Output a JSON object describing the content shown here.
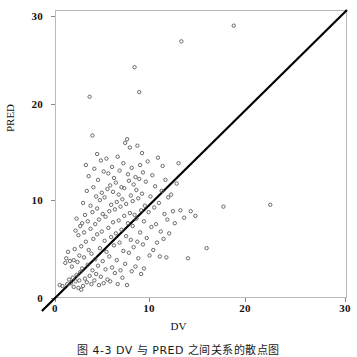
{
  "figure": {
    "caption": "图 4-3  DV 与 PRED 之间关系的散点图"
  },
  "axes": {
    "xlabel": "DV",
    "ylabel": "PRED",
    "x_ticks": [
      "0",
      "10",
      "20",
      "30"
    ],
    "y_ticks": [
      "0",
      "10",
      "20",
      "30"
    ]
  },
  "chart_data": {
    "type": "scatter",
    "title": "",
    "xlabel": "DV",
    "ylabel": "PRED",
    "xlim": [
      0,
      31.2
    ],
    "ylim": [
      0,
      31.2
    ],
    "xticks": [
      0,
      10,
      20,
      30
    ],
    "yticks": [
      0,
      10,
      20,
      30
    ],
    "grid": false,
    "legend": null,
    "marker": {
      "style": "open-circle",
      "size_px": 3.4,
      "color": "#5a5a5a",
      "fill": "none"
    },
    "reference_line": {
      "name": "identity-line",
      "type": "line",
      "equation": "y = x",
      "slope": 1,
      "intercept": 0,
      "x_from": -1.4,
      "x_to": 31.2,
      "color": "#000000",
      "width_px": 2.2
    },
    "series": [
      {
        "name": "DV vs PRED",
        "points": [
          [
            0.5,
            1.4
          ],
          [
            0.8,
            1.3
          ],
          [
            1.1,
            3.8
          ],
          [
            1.2,
            4.3
          ],
          [
            1.3,
            1.5
          ],
          [
            1.4,
            5.0
          ],
          [
            1.5,
            2.0
          ],
          [
            1.6,
            4.0
          ],
          [
            1.7,
            1.6
          ],
          [
            1.8,
            3.4
          ],
          [
            1.9,
            2.2
          ],
          [
            2.0,
            1.2
          ],
          [
            2.0,
            4.1
          ],
          [
            2.1,
            5.3
          ],
          [
            2.2,
            1.8
          ],
          [
            2.2,
            7.3
          ],
          [
            2.3,
            2.5
          ],
          [
            2.3,
            8.6
          ],
          [
            2.4,
            3.9
          ],
          [
            2.5,
            1.1
          ],
          [
            2.5,
            6.8
          ],
          [
            2.6,
            4.6
          ],
          [
            2.6,
            1.9
          ],
          [
            2.7,
            7.8
          ],
          [
            2.7,
            2.8
          ],
          [
            2.8,
            5.6
          ],
          [
            2.8,
            0.9
          ],
          [
            2.9,
            8.1
          ],
          [
            2.9,
            3.2
          ],
          [
            3.0,
            1.3
          ],
          [
            3.0,
            10.3
          ],
          [
            3.1,
            7.1
          ],
          [
            3.1,
            4.4
          ],
          [
            3.2,
            2.1
          ],
          [
            3.2,
            9.0
          ],
          [
            3.3,
            14.4
          ],
          [
            3.3,
            6.1
          ],
          [
            3.4,
            1.7
          ],
          [
            3.4,
            11.6
          ],
          [
            3.5,
            3.6
          ],
          [
            3.5,
            8.3
          ],
          [
            3.6,
            13.2
          ],
          [
            3.6,
            5.2
          ],
          [
            3.7,
            21.8
          ],
          [
            3.7,
            2.4
          ],
          [
            3.8,
            10.0
          ],
          [
            3.8,
            7.5
          ],
          [
            3.9,
            4.8
          ],
          [
            3.9,
            1.5
          ],
          [
            4.0,
            17.6
          ],
          [
            4.0,
            9.3
          ],
          [
            4.0,
            3.0
          ],
          [
            4.1,
            12.0
          ],
          [
            4.1,
            6.4
          ],
          [
            4.2,
            1.9
          ],
          [
            4.2,
            14.0
          ],
          [
            4.3,
            8.0
          ],
          [
            4.3,
            4.2
          ],
          [
            4.4,
            11.0
          ],
          [
            4.4,
            2.6
          ],
          [
            4.5,
            15.6
          ],
          [
            4.5,
            6.9
          ],
          [
            4.5,
            9.7
          ],
          [
            4.6,
            3.5
          ],
          [
            4.6,
            12.8
          ],
          [
            4.7,
            1.4
          ],
          [
            4.7,
            8.5
          ],
          [
            4.8,
            5.4
          ],
          [
            4.8,
            10.6
          ],
          [
            4.9,
            14.9
          ],
          [
            4.9,
            2.3
          ],
          [
            5.0,
            7.2
          ],
          [
            5.0,
            11.4
          ],
          [
            5.1,
            4.0
          ],
          [
            5.1,
            9.1
          ],
          [
            5.2,
            13.7
          ],
          [
            5.2,
            1.6
          ],
          [
            5.3,
            6.2
          ],
          [
            5.3,
            10.9
          ],
          [
            5.4,
            3.1
          ],
          [
            5.4,
            8.8
          ],
          [
            5.5,
            15.1
          ],
          [
            5.5,
            5.0
          ],
          [
            5.6,
            11.8
          ],
          [
            5.6,
            2.0
          ],
          [
            5.7,
            7.6
          ],
          [
            5.7,
            13.5
          ],
          [
            5.8,
            9.4
          ],
          [
            5.8,
            4.5
          ],
          [
            5.9,
            12.2
          ],
          [
            5.9,
            1.8
          ],
          [
            6.0,
            6.6
          ],
          [
            6.0,
            10.1
          ],
          [
            6.1,
            14.2
          ],
          [
            6.1,
            3.3
          ],
          [
            6.2,
            8.2
          ],
          [
            6.2,
            11.5
          ],
          [
            6.3,
            5.7
          ],
          [
            6.3,
            13.0
          ],
          [
            6.4,
            2.7
          ],
          [
            6.4,
            9.6
          ],
          [
            6.5,
            7.0
          ],
          [
            6.5,
            12.5
          ],
          [
            6.6,
            4.1
          ],
          [
            6.6,
            10.4
          ],
          [
            6.7,
            15.3
          ],
          [
            6.7,
            1.5
          ],
          [
            6.8,
            8.4
          ],
          [
            6.8,
            11.2
          ],
          [
            6.9,
            6.0
          ],
          [
            6.9,
            13.8
          ],
          [
            7.0,
            3.0
          ],
          [
            7.0,
            9.9
          ],
          [
            7.1,
            12.0
          ],
          [
            7.1,
            7.4
          ],
          [
            7.2,
            2.2
          ],
          [
            7.2,
            10.7
          ],
          [
            7.3,
            14.6
          ],
          [
            7.3,
            5.1
          ],
          [
            7.4,
            8.9
          ],
          [
            7.4,
            11.9
          ],
          [
            7.5,
            3.7
          ],
          [
            7.5,
            16.8
          ],
          [
            7.6,
            6.7
          ],
          [
            7.6,
            10.2
          ],
          [
            7.7,
            17.2
          ],
          [
            7.7,
            1.4
          ],
          [
            7.8,
            13.4
          ],
          [
            7.8,
            8.1
          ],
          [
            7.9,
            12.7
          ],
          [
            7.9,
            4.9
          ],
          [
            8.0,
            16.3
          ],
          [
            8.0,
            9.2
          ],
          [
            8.1,
            11.1
          ],
          [
            8.1,
            6.3
          ],
          [
            8.2,
            14.1
          ],
          [
            8.2,
            2.9
          ],
          [
            8.3,
            10.5
          ],
          [
            8.3,
            7.8
          ],
          [
            8.4,
            12.3
          ],
          [
            8.4,
            5.5
          ],
          [
            8.5,
            25.0
          ],
          [
            8.5,
            9.0
          ],
          [
            8.6,
            13.1
          ],
          [
            8.6,
            3.4
          ],
          [
            8.7,
            11.7
          ],
          [
            8.7,
            8.6
          ],
          [
            8.8,
            16.5
          ],
          [
            8.8,
            6.1
          ],
          [
            8.9,
            10.8
          ],
          [
            8.9,
            4.3
          ],
          [
            9.0,
            22.3
          ],
          [
            9.0,
            12.9
          ],
          [
            9.1,
            14.4
          ],
          [
            9.1,
            7.1
          ],
          [
            9.2,
            9.5
          ],
          [
            9.2,
            2.6
          ],
          [
            9.3,
            15.7
          ],
          [
            9.3,
            11.3
          ],
          [
            9.4,
            5.8
          ],
          [
            9.4,
            13.6
          ],
          [
            9.5,
            8.3
          ],
          [
            9.5,
            3.2
          ],
          [
            9.6,
            10.0
          ],
          [
            9.7,
            12.6
          ],
          [
            9.8,
            6.5
          ],
          [
            9.9,
            14.8
          ],
          [
            10.0,
            9.3
          ],
          [
            10.1,
            4.6
          ],
          [
            10.2,
            11.0
          ],
          [
            10.3,
            7.7
          ],
          [
            10.4,
            13.3
          ],
          [
            10.5,
            5.2
          ],
          [
            10.6,
            9.8
          ],
          [
            10.7,
            12.1
          ],
          [
            10.8,
            8.0
          ],
          [
            10.9,
            6.0
          ],
          [
            11.0,
            15.2
          ],
          [
            11.1,
            10.3
          ],
          [
            11.2,
            4.5
          ],
          [
            11.3,
            7.2
          ],
          [
            11.4,
            11.6
          ],
          [
            11.5,
            14.3
          ],
          [
            11.6,
            6.4
          ],
          [
            11.7,
            9.1
          ],
          [
            11.8,
            12.8
          ],
          [
            11.9,
            4.4
          ],
          [
            12.0,
            8.5
          ],
          [
            12.1,
            10.9
          ],
          [
            12.2,
            7.0
          ],
          [
            12.4,
            11.2
          ],
          [
            12.6,
            9.4
          ],
          [
            12.8,
            8.1
          ],
          [
            13.0,
            12.4
          ],
          [
            13.2,
            14.6
          ],
          [
            13.4,
            9.5
          ],
          [
            13.5,
            27.8
          ],
          [
            13.8,
            8.7
          ],
          [
            14.2,
            4.3
          ],
          [
            14.5,
            9.4
          ],
          [
            15.0,
            8.9
          ],
          [
            16.2,
            5.4
          ],
          [
            18.0,
            9.9
          ],
          [
            19.1,
            29.5
          ],
          [
            23.0,
            10.1
          ]
        ]
      }
    ]
  }
}
